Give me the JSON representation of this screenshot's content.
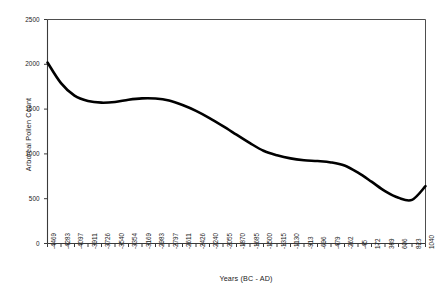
{
  "chart_data": {
    "type": "line",
    "title": "",
    "xlabel": "Years (BC - AD)",
    "ylabel": "Arboreal Pollen Count",
    "ylim": [
      0,
      2500
    ],
    "yticks": [
      0,
      500,
      1000,
      1500,
      2000,
      2500
    ],
    "ytick_labels": [
      "0",
      "500",
      "1000",
      "1500",
      "2000",
      "2500"
    ],
    "grid": false,
    "legend": null,
    "categories": [
      "-4469",
      "-4283",
      "-4097",
      "-3911",
      "-3726",
      "-3540",
      "-3354",
      "-3169",
      "-2983",
      "-2797",
      "-2611",
      "-2426",
      "-2240",
      "-2055",
      "-1870",
      "-1685",
      "-1500",
      "-1315",
      "-1130",
      "-913",
      "-696",
      "-479",
      "-262",
      "-45",
      "172",
      "389",
      "606",
      "823",
      "1040"
    ],
    "x": [
      -4469,
      -4283,
      -4097,
      -3911,
      -3726,
      -3540,
      -3354,
      -3169,
      -2983,
      -2797,
      -2611,
      -2426,
      -2240,
      -2055,
      -1870,
      -1685,
      -1500,
      -1315,
      -1130,
      -913,
      -696,
      -479,
      -262,
      -45,
      172,
      389,
      606,
      823,
      1040
    ],
    "values": [
      2020,
      1790,
      1650,
      1590,
      1572,
      1580,
      1605,
      1620,
      1618,
      1595,
      1545,
      1480,
      1400,
      1310,
      1215,
      1120,
      1035,
      985,
      950,
      930,
      920,
      905,
      870,
      790,
      690,
      585,
      510,
      487,
      640
    ],
    "series_name": "Arboreal Pollen Count",
    "line_color": "#000000",
    "line_width": 2.6,
    "axes_color": "#3a3a3a",
    "background": "#ffffff"
  }
}
